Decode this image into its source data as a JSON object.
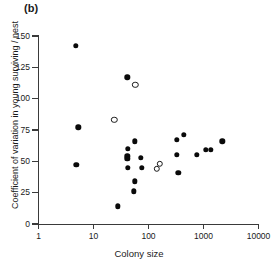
{
  "panel": {
    "label": "(b)"
  },
  "chart_data": {
    "type": "scatter",
    "title": "",
    "subtitle": "",
    "xlabel": "Colony size",
    "ylabel": "Coefficient of variation in young surviving / nest",
    "xscale": "log",
    "yscale": "linear",
    "xlim": [
      1,
      10000
    ],
    "ylim": [
      0,
      150
    ],
    "xticks": [
      1,
      10,
      100,
      1000,
      10000
    ],
    "xtick_labels": [
      "1",
      "10",
      "100",
      "1000",
      "10000"
    ],
    "yticks": [
      0,
      25,
      50,
      75,
      100,
      125,
      150
    ],
    "ytick_labels": [
      "0",
      "25",
      "50",
      "75",
      "100",
      "125",
      "150"
    ],
    "grid": false,
    "legend": null,
    "series": [
      {
        "name": "filled",
        "marker": "filled-circle",
        "color": "#0a0a0a",
        "points": [
          [
            4.8,
            142
          ],
          [
            5.3,
            77
          ],
          [
            4.9,
            47
          ],
          [
            41,
            117
          ],
          [
            28,
            14
          ],
          [
            42,
            60
          ],
          [
            41,
            54
          ],
          [
            41,
            52
          ],
          [
            42,
            45
          ],
          [
            56,
            66
          ],
          [
            57,
            34
          ],
          [
            54,
            26
          ],
          [
            72,
            53
          ],
          [
            76,
            45
          ],
          [
            330,
            67
          ],
          [
            440,
            71
          ],
          [
            330,
            55
          ],
          [
            350,
            41
          ],
          [
            760,
            55
          ],
          [
            1100,
            59
          ],
          [
            1350,
            59
          ],
          [
            2200,
            66
          ]
        ]
      },
      {
        "name": "open",
        "marker": "open-circle",
        "color": "#1a1a1a",
        "points": [
          [
            58,
            111
          ],
          [
            24,
            83
          ],
          [
            160,
            48
          ],
          [
            140,
            44
          ]
        ]
      }
    ]
  }
}
